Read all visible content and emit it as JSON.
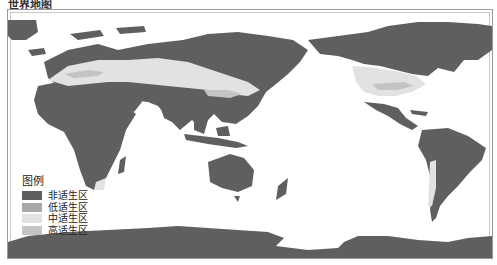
{
  "title": "世界地图",
  "legend": {
    "title": "图例",
    "items": [
      {
        "label": "非适生区",
        "color": "#5f5f5f"
      },
      {
        "label": "低适生区",
        "color": "#a9a9a9"
      },
      {
        "label": "中适生区",
        "color": "#e2e2e2"
      },
      {
        "label": "高适生区",
        "color": "#c4c4c4"
      }
    ]
  },
  "colors": {
    "unsuitable": "#5f5f5f",
    "low": "#a9a9a9",
    "medium": "#e2e2e2",
    "high": "#c4c4c4",
    "ocean": "#ffffff",
    "frame": "#9a9a9a"
  }
}
